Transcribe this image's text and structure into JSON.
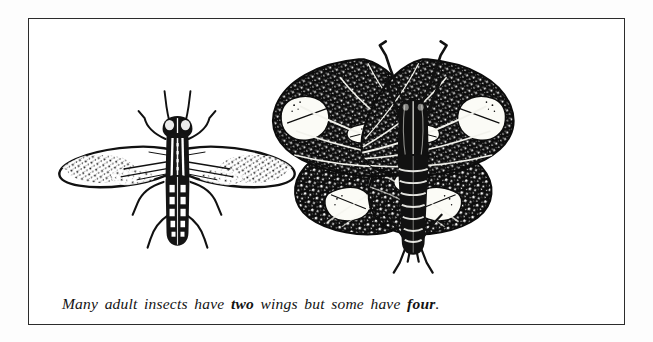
{
  "figure": {
    "caption": {
      "segment_1": "Many adult insects have ",
      "emphasis_1": "two",
      "segment_2": " wings but some have ",
      "emphasis_2": "four",
      "segment_3": ".",
      "full_text": "Many adult insects have two wings but some have four."
    },
    "border_color": "#2c2c2c",
    "background_color": "#ffffff",
    "ink_color": "#111111",
    "page_color": "#fdfdfd"
  },
  "specimens": [
    {
      "id": "fly",
      "name": "two-winged-fly",
      "common_label": "fly",
      "wing_count": 2,
      "position": "left",
      "description": "Black-and-white stipple engraving of an adult fly with one pair of outspread speckled wings, banded abdomen, six legs and a pair of antennae."
    },
    {
      "id": "moth",
      "name": "four-winged-moth",
      "common_label": "moth",
      "wing_count": 4,
      "position": "right",
      "description": "Black-and-white stipple engraving of an adult moth with two pairs of dark speckled wings bearing pale white blotches, a segmented banded abdomen, six legs and two curved antennae."
    }
  ]
}
